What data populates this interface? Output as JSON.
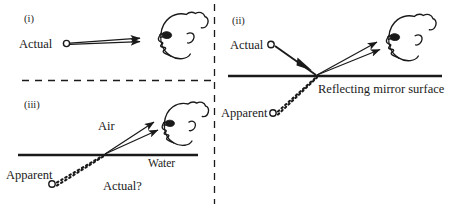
{
  "figure": {
    "width": 449,
    "height": 208,
    "background": "#ffffff",
    "ink": "#1a1a1a"
  },
  "panels": [
    {
      "id": "i",
      "tag": "(i)",
      "name": "direct-view",
      "labels": {
        "source": "Actual"
      },
      "icons": {
        "observer": "head-profile-icon",
        "source_point": "open-circle-icon",
        "ray": "double-ray-arrow-icon"
      }
    },
    {
      "id": "ii",
      "tag": "(ii)",
      "name": "mirror-reflection",
      "labels": {
        "source": "Actual",
        "apparent": "Apparent",
        "surface": "Reflecting mirror surface"
      },
      "icons": {
        "observer": "head-profile-icon",
        "source_point": "open-circle-icon",
        "apparent_point": "open-circle-icon",
        "incident_ray": "arrow-icon",
        "reflected_ray": "double-ray-arrow-icon",
        "virtual_ray": "dotted-ray-icon",
        "surface_line": "solid-horizontal-line-icon"
      }
    },
    {
      "id": "iii",
      "tag": "(iii)",
      "name": "refraction-water",
      "labels": {
        "air": "Air",
        "water": "Water",
        "apparent": "Apparent",
        "actual": "Actual?"
      },
      "icons": {
        "observer": "head-profile-icon",
        "apparent_point": "open-circle-icon",
        "refracted_ray": "double-ray-arrow-icon",
        "virtual_ray": "dotted-ray-icon",
        "surface_line": "solid-horizontal-line-icon"
      }
    }
  ],
  "dividers": {
    "vertical": "dashed-vertical-divider",
    "horizontal": "dashed-horizontal-divider"
  },
  "colors": {
    "ink": "#1a1a1a",
    "background": "#ffffff"
  }
}
